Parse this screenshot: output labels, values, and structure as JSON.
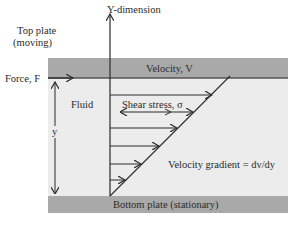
{
  "diagram": {
    "type": "couette-flow",
    "axis_label": "Y-dimension",
    "top_plate_label": "Top plate",
    "top_plate_sub": "(moving)",
    "force_label": "Force, F",
    "velocity_label": "Velocity, V",
    "fluid_label": "Fluid",
    "y_label": "y",
    "shear_label": "Shear stress, σ",
    "gradient_label": "Velocity gradient = dv/dy",
    "bottom_plate_label": "Bottom plate (stationary)"
  },
  "colors": {
    "plate": "#a9a9a9",
    "plate_edge": "#555555",
    "fluid": "#ececec",
    "line": "#2a2a2a"
  }
}
